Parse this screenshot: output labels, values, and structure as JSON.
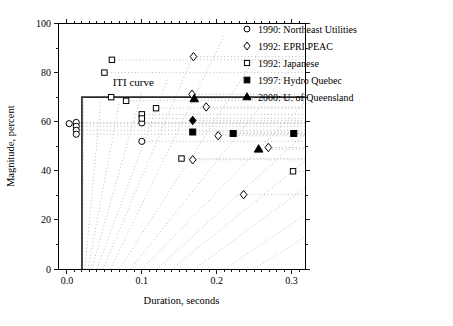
{
  "figure": {
    "background": "#ffffff",
    "axis_color": "#000000",
    "text_color": "#000000",
    "guide_color": "#b5b5b5",
    "iti_color": "#2a2a2a"
  },
  "chart_data": {
    "type": "scatter",
    "title": "",
    "xlabel": "Duration, seconds",
    "ylabel": "Magnitude, percent",
    "xlim": [
      -0.012,
      0.318
    ],
    "ylim": [
      0,
      100
    ],
    "grid": false,
    "legend_position": "top-right-outside",
    "x_major_ticks": [
      0.0,
      0.1,
      0.2,
      0.3
    ],
    "x_tick_labels": [
      "0.0",
      "0.1",
      "0.2",
      "0.3"
    ],
    "x_minor_step": 0.01,
    "y_major_ticks": [
      0,
      20,
      40,
      60,
      80,
      100
    ],
    "y_tick_labels": [
      "0",
      "20",
      "40",
      "60",
      "80",
      "100"
    ],
    "y_minor_step": 10,
    "annotation": {
      "text": "ITI curve",
      "x": 0.061,
      "y": 74.5
    },
    "iti_curve_points": [
      [
        0.02,
        0
      ],
      [
        0.02,
        70
      ],
      [
        0.318,
        70
      ]
    ],
    "series": [
      {
        "name": "1990: Northeast Utilities",
        "marker": "circle",
        "fill": "open",
        "points": [
          [
            0.003,
            59.2
          ],
          [
            0.0124,
            59.7
          ],
          [
            0.0124,
            58.1
          ],
          [
            0.0124,
            56.5
          ],
          [
            0.0124,
            54.9
          ],
          [
            0.1,
            59.5
          ],
          [
            0.1,
            52
          ]
        ]
      },
      {
        "name": "1992: EPRI PEAC",
        "marker": "diamond",
        "fill": "open",
        "points": [
          [
            0.169,
            86.5
          ],
          [
            0.167,
            71.2
          ],
          [
            0.186,
            66
          ],
          [
            0.202,
            54.3
          ],
          [
            0.269,
            49.5
          ],
          [
            0.236,
            30.3
          ],
          [
            0.168,
            44.5
          ]
        ]
      },
      {
        "name": "1992: Japanese",
        "marker": "square",
        "fill": "open",
        "points": [
          [
            0.05,
            80
          ],
          [
            0.06,
            85.2
          ],
          [
            0.059,
            70
          ],
          [
            0.079,
            68.5
          ],
          [
            0.1,
            63
          ],
          [
            0.1,
            61.3
          ],
          [
            0.119,
            65.5
          ],
          [
            0.153,
            45
          ],
          [
            0.302,
            39.8
          ]
        ]
      },
      {
        "name": "1997: Hydro Quebec",
        "marker": "square",
        "fill": "filled",
        "points": [
          [
            0.168,
            55.8
          ],
          [
            0.222,
            55.2
          ],
          [
            0.303,
            55.2
          ]
        ]
      },
      {
        "name": "2000: U. of Queensland",
        "marker": "triangle",
        "fill": "filled",
        "points": [
          [
            0.17,
            69.3
          ],
          [
            0.256,
            48.8
          ]
        ]
      }
    ],
    "overlap_markers": [
      {
        "marker": "diamond",
        "fill": "filled",
        "point": [
          0.168,
          60.5
        ]
      }
    ],
    "fan_guide_lines": [
      [
        [
          0.021,
          0
        ],
        [
          0.022,
          68
        ]
      ],
      [
        [
          0.024,
          0
        ],
        [
          0.045,
          68
        ]
      ],
      [
        [
          0.028,
          0
        ],
        [
          0.07,
          68
        ]
      ],
      [
        [
          0.033,
          0
        ],
        [
          0.1,
          72
        ]
      ],
      [
        [
          0.04,
          0
        ],
        [
          0.135,
          78
        ]
      ],
      [
        [
          0.048,
          0
        ],
        [
          0.17,
          88
        ]
      ],
      [
        [
          0.058,
          0
        ],
        [
          0.21,
          95
        ]
      ],
      [
        [
          0.07,
          0
        ],
        [
          0.26,
          90
        ]
      ],
      [
        [
          0.085,
          0
        ],
        [
          0.3,
          82
        ]
      ],
      [
        [
          0.1,
          0
        ],
        [
          0.318,
          68
        ]
      ],
      [
        [
          0.12,
          0
        ],
        [
          0.318,
          55
        ]
      ],
      [
        [
          0.14,
          0
        ],
        [
          0.318,
          44
        ]
      ],
      [
        [
          0.17,
          0
        ],
        [
          0.318,
          33
        ]
      ],
      [
        [
          0.21,
          0
        ],
        [
          0.318,
          22
        ]
      ],
      [
        [
          0.25,
          0
        ],
        [
          0.318,
          13
        ]
      ]
    ],
    "horizontal_guides_from_points": true
  }
}
